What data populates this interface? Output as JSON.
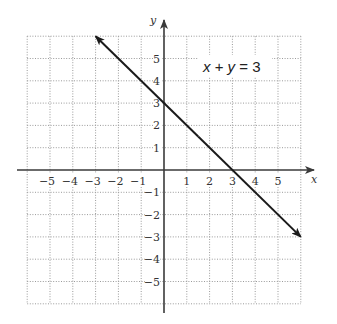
{
  "chart_data": {
    "type": "line",
    "title": "",
    "annotation": {
      "parts": [
        {
          "text": "x",
          "italic": true
        },
        {
          "text": " + ",
          "italic": false
        },
        {
          "text": "y",
          "italic": true
        },
        {
          "text": " = 3",
          "italic": false
        }
      ],
      "full_text": "x + y = 3",
      "position": {
        "x": 3.1,
        "y": 4.6
      }
    },
    "xlabel": "x",
    "ylabel": "y",
    "xlim": [
      -6,
      6
    ],
    "ylim": [
      -6,
      6
    ],
    "grid": true,
    "x_ticks": [
      -5,
      -4,
      -3,
      -2,
      -1,
      1,
      2,
      3,
      4,
      5
    ],
    "y_ticks": [
      5,
      4,
      3,
      2,
      1,
      -1,
      -2,
      -3,
      -4,
      -5
    ],
    "x_tick_labels": [
      "−5",
      "−4",
      "−3",
      "−2",
      "−1",
      "1",
      "2",
      "3",
      "4",
      "5"
    ],
    "y_tick_labels": [
      "5",
      "4",
      "3",
      "2",
      "1",
      "−1",
      "−2",
      "−3",
      "−4",
      "−5"
    ],
    "series": [
      {
        "name": "x + y = 3",
        "equation": "y = 3 - x",
        "x": [
          -3,
          6
        ],
        "y": [
          6,
          -3
        ],
        "arrows": "both",
        "color": "#1a1a1a"
      }
    ],
    "intercepts": {
      "x_intercept": [
        3,
        0
      ],
      "y_intercept": [
        0,
        3
      ]
    }
  },
  "colors": {
    "grid": "#9a9a9a",
    "axis": "#3a3a3a",
    "line": "#1a1a1a",
    "text": "#333333"
  }
}
